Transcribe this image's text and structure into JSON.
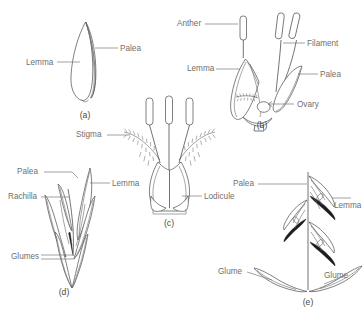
{
  "figure": {
    "background_color": "#ffffff",
    "line_color": "#555555",
    "label_color": "#6f6f6f"
  },
  "panels": [
    {
      "id": "a",
      "letter": "(a)",
      "caption": "Single floret showing lemma and palea",
      "labels": [
        {
          "name": "lemma",
          "text": "Lemma"
        },
        {
          "name": "palea",
          "text": "Palea"
        }
      ]
    },
    {
      "id": "b",
      "letter": "(b)",
      "caption": "Opened floret with stamens and ovary",
      "labels": [
        {
          "name": "anther",
          "text": "Anther"
        },
        {
          "name": "lemma",
          "text": "Lemma"
        },
        {
          "name": "filament",
          "text": "Filament"
        },
        {
          "name": "palea",
          "text": "Palea"
        },
        {
          "name": "ovary",
          "text": "Ovary"
        }
      ]
    },
    {
      "id": "c",
      "letter": "(c)",
      "caption": "Pistil with feathery stigmas and lodicules",
      "labels": [
        {
          "name": "stigma",
          "text": "Stigma"
        },
        {
          "name": "lodicule",
          "text": "Lodicule"
        }
      ]
    },
    {
      "id": "d",
      "letter": "(d)",
      "caption": "Intact spikelet",
      "labels": [
        {
          "name": "palea",
          "text": "Palea"
        },
        {
          "name": "lemma",
          "text": "Lemma"
        },
        {
          "name": "rachilla",
          "text": "Rachilla"
        },
        {
          "name": "glumes",
          "text": "Glumes"
        }
      ]
    },
    {
      "id": "e",
      "letter": "(e)",
      "caption": "Dissected spikelet on rachilla",
      "labels": [
        {
          "name": "palea",
          "text": "Palea"
        },
        {
          "name": "lemma",
          "text": "Lemma"
        },
        {
          "name": "glume-left",
          "text": "Glume"
        },
        {
          "name": "glume-right",
          "text": "Glume"
        }
      ]
    }
  ]
}
